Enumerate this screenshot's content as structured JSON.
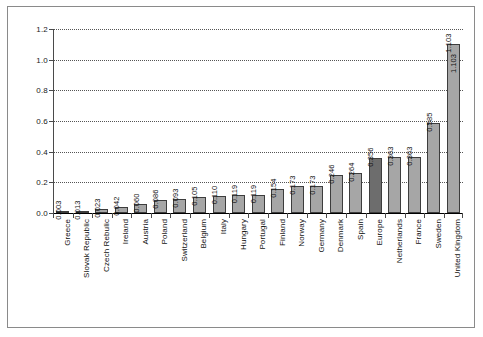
{
  "chart_data": {
    "type": "bar",
    "title": "",
    "subtitle": "",
    "xlabel": "",
    "ylabel": "",
    "ylim": [
      0.0,
      1.2
    ],
    "ytick_labels": [
      "1.2",
      "1.0",
      "0.8",
      "0.6",
      "0.4",
      "0.2",
      "0.0"
    ],
    "ytick_values": [
      1.2,
      1.0,
      0.8,
      0.6,
      0.4,
      0.2,
      0.0
    ],
    "grid": true,
    "grid_style": "dotted-horizontal",
    "legend": "none",
    "categories": [
      "Greece",
      "Slovak Republic",
      "Czech Rebulic",
      "Ireland",
      "Austria",
      "Poland",
      "Switzerland",
      "Belgium",
      "Italy",
      "Hungary",
      "Portugal",
      "Finland",
      "Norway",
      "Germany",
      "Denmark",
      "Spain",
      "Europe",
      "Netherlands",
      "France",
      "Sweden",
      "United Kingdom"
    ],
    "values": [
      0.003,
      0.013,
      0.023,
      0.042,
      0.06,
      0.086,
      0.093,
      0.105,
      0.11,
      0.119,
      0.119,
      0.154,
      0.173,
      0.173,
      0.246,
      0.264,
      0.356,
      0.363,
      0.363,
      0.585,
      1.103
    ],
    "value_labels": [
      "0.003",
      "0.013",
      "0.023",
      "0.042",
      "0.060",
      "0.086",
      "0.093",
      "0.105",
      "0.110",
      "0.119",
      "0.119",
      "0.154",
      "0.173",
      "0.173",
      "0.246",
      "0.264",
      "0.356",
      "0.363",
      "0.363",
      "0.585",
      "1.103"
    ],
    "highlight_index": 16,
    "highlight_category": "Europe",
    "inside_label_index": 20,
    "inside_label_text": "1.103",
    "colors": {
      "bar_fill": "#a6a6a6",
      "bar_highlight_fill": "#6d6d6d",
      "bar_border": "#3d3d3d",
      "gridline": "#555555",
      "axis": "#4a4a4a",
      "frame": "#8a8a8a",
      "background": "#ffffff",
      "text": "#111111"
    }
  }
}
